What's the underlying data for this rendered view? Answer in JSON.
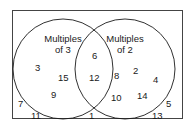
{
  "diagram": {
    "type": "venn",
    "sets": [
      {
        "name": "Multiples of 3",
        "title_line1": "Multiples",
        "title_line2": "of 3"
      },
      {
        "name": "Multiples of 2",
        "title_line1": "Multiples",
        "title_line2": "of 2"
      }
    ],
    "regions": {
      "only_multiples_of_3": [
        "3",
        "15",
        "9"
      ],
      "both": [
        "6",
        "12"
      ],
      "only_multiples_of_2": [
        "8",
        "2",
        "4",
        "10",
        "14"
      ],
      "neither": [
        "7",
        "11",
        "1",
        "5",
        "13"
      ]
    },
    "colors": {
      "stroke": "#1a1a1a",
      "background": "#ffffff"
    }
  }
}
